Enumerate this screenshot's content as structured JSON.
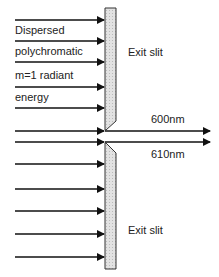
{
  "diagram": {
    "input_label_lines": [
      "Dispersed",
      "polychromatic",
      "m=1 radiant",
      "energy"
    ],
    "exit_slit_top_label": "Exit slit",
    "exit_slit_bottom_label": "Exit slit",
    "output_beams": [
      {
        "label": "600nm",
        "y": 131
      },
      {
        "label": "610nm",
        "y": 142
      }
    ],
    "input_arrow_ys": [
      20,
      41,
      62,
      87,
      108,
      131,
      142,
      164,
      189,
      211,
      234,
      257
    ],
    "colors": {
      "line": "#111111",
      "slit_fill": "#d9d9d9",
      "slit_border": "#333333"
    }
  }
}
